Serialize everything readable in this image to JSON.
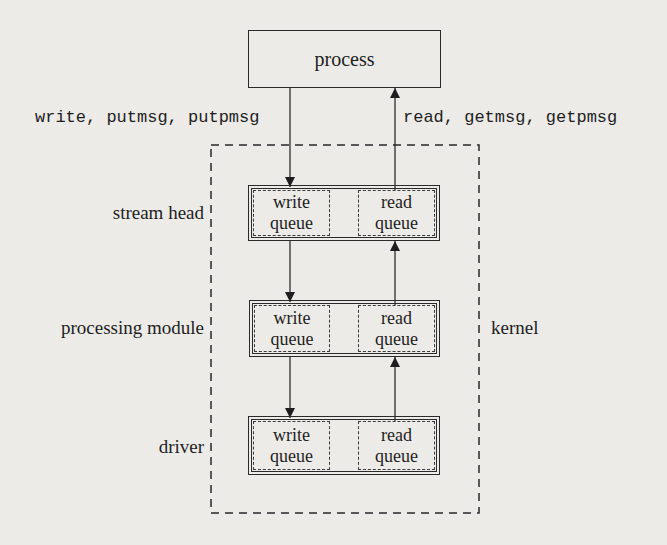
{
  "figure": {
    "process_label": "process",
    "downcall_label": "write, putmsg, putpmsg",
    "upcall_label": "read, getmsg, getpmsg",
    "kernel_label": "kernel",
    "layers": [
      {
        "label": "stream head",
        "write_queue": [
          "write",
          "queue"
        ],
        "read_queue": [
          "read",
          "queue"
        ]
      },
      {
        "label": "processing module",
        "write_queue": [
          "write",
          "queue"
        ],
        "read_queue": [
          "read",
          "queue"
        ]
      },
      {
        "label": "driver",
        "write_queue": [
          "write",
          "queue"
        ],
        "read_queue": [
          "read",
          "queue"
        ]
      }
    ]
  },
  "colors": {
    "background": "#ecebe8",
    "ink": "#1e1e1e"
  }
}
